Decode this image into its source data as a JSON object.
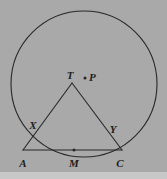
{
  "figure": {
    "kind": "euclidean-geometry-diagram",
    "background_color": "#a9a9a9",
    "bottom_strip_color": "#c8c8c8",
    "stroke_color": "#272727",
    "label_color": "#1d1d1d",
    "stroke_width": 1.1,
    "label_font_size": 11
  },
  "circle": {
    "name": "main-circle",
    "center_x": 84,
    "center_y": 84,
    "radius": 73,
    "top_y": 11,
    "bottom_y": 157,
    "left_x": 11,
    "right_x": 157
  },
  "triangle": {
    "name": "triangle-TAC",
    "vertices": [
      {
        "id": "T",
        "x": 72,
        "y": 83
      },
      {
        "id": "A",
        "x": 23,
        "y": 150
      },
      {
        "id": "C",
        "x": 122,
        "y": 150
      }
    ]
  },
  "points": [
    {
      "id": "T",
      "label": "T",
      "x": 72,
      "y": 83,
      "label_x": 70,
      "label_y": 79,
      "dot": false,
      "anchor": "middle"
    },
    {
      "id": "P",
      "label": "P",
      "x": 85,
      "y": 78,
      "label_x": 89,
      "label_y": 81,
      "dot": true,
      "anchor": "start"
    },
    {
      "id": "X",
      "label": "X",
      "x": 37,
      "y": 131,
      "label_x": 33,
      "label_y": 129,
      "dot": false,
      "anchor": "middle"
    },
    {
      "id": "Y",
      "label": "Y",
      "x": 113,
      "y": 136,
      "label_x": 113,
      "label_y": 133,
      "dot": false,
      "anchor": "middle"
    },
    {
      "id": "A",
      "label": "A",
      "x": 23,
      "y": 150,
      "label_x": 23,
      "label_y": 167,
      "dot": false,
      "anchor": "middle"
    },
    {
      "id": "M",
      "label": "M",
      "x": 74,
      "y": 150,
      "label_x": 74,
      "label_y": 167,
      "dot": true,
      "anchor": "middle"
    },
    {
      "id": "C",
      "label": "C",
      "x": 122,
      "y": 150,
      "label_x": 120,
      "label_y": 167,
      "dot": false,
      "anchor": "middle"
    }
  ],
  "segments": [
    {
      "name": "segment-TA",
      "from": "T",
      "to": "A"
    },
    {
      "name": "segment-TC",
      "from": "T",
      "to": "C"
    },
    {
      "name": "segment-AC",
      "from": "A",
      "to": "C"
    }
  ]
}
